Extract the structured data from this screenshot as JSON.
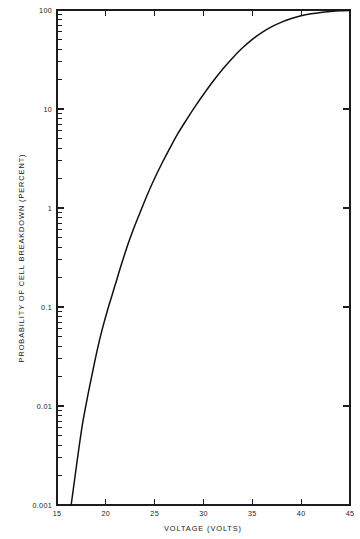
{
  "chart_data": {
    "type": "line",
    "title": "",
    "xlabel": "VOLTAGE (VOLTS)",
    "ylabel": "PROBABILITY OF CELL BREAKDOWN (PERCENT)",
    "xscale": "linear",
    "yscale": "log",
    "xlim": [
      15,
      45
    ],
    "ylim": [
      0.001,
      100
    ],
    "grid": false,
    "legend": null,
    "xticks": [
      15,
      20,
      25,
      30,
      35,
      40,
      45
    ],
    "xticklabels": [
      "15",
      "20",
      "25",
      "30",
      "35",
      "40",
      "45"
    ],
    "yticks": [
      0.001,
      0.01,
      0.1,
      1,
      10,
      100
    ],
    "yticklabels": [
      "0.001",
      "0.01",
      "0.1",
      "1",
      "10",
      "100"
    ],
    "y_minor_ticks": true,
    "series": [
      {
        "name": "Probability of cell breakdown",
        "x": [
          16.45,
          16.8,
          17.2,
          17.6,
          18.1,
          18.6,
          19.1,
          19.6,
          20.2,
          20.9,
          21.6,
          22.3,
          22.9,
          23.6,
          24.3,
          25.0,
          25.8,
          26.6,
          27.4,
          28.3,
          29.2,
          30.1,
          31.0,
          32.0,
          33.0,
          34.0,
          35.0,
          36.0,
          37.0,
          38.0,
          39.0,
          40.0,
          41.0,
          42.0,
          43.0,
          44.0,
          45.0
        ],
        "y": [
          0.001,
          0.0018,
          0.0035,
          0.0065,
          0.012,
          0.021,
          0.036,
          0.058,
          0.095,
          0.16,
          0.27,
          0.44,
          0.64,
          0.95,
          1.4,
          2.0,
          2.9,
          4.1,
          5.7,
          7.9,
          10.8,
          14.5,
          19.2,
          25.5,
          33.0,
          41.5,
          50.5,
          59.5,
          68.0,
          75.5,
          82.0,
          87.5,
          91.5,
          94.5,
          96.5,
          98.0,
          99.0
        ]
      }
    ],
    "annotations": []
  },
  "axes": {
    "x_axis_label": "VOLTAGE (VOLTS)",
    "y_axis_label": "PROBABILITY OF CELL BREAKDOWN (PERCENT)"
  }
}
